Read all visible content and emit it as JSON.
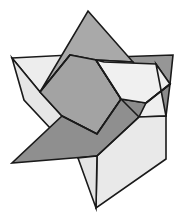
{
  "figure": {
    "canvas": {
      "width": 186,
      "height": 221,
      "background": "#ffffff"
    },
    "palette": {
      "medium_gray": "#a8a8a8",
      "dark_gray": "#909090",
      "light_gray": "#e2e2e2",
      "pale_gray": "#ededed",
      "bright_gray": "#f2f2f2",
      "outline": "#1a1a1a"
    },
    "star_points": [
      {
        "name": "top",
        "x": 88,
        "y": 11
      },
      {
        "name": "upper-left",
        "x": 12,
        "y": 58
      },
      {
        "name": "upper-right",
        "x": 173,
        "y": 55
      },
      {
        "name": "lower-left",
        "x": 12,
        "y": 163
      },
      {
        "name": "lower-right",
        "x": 166,
        "y": 159
      },
      {
        "name": "bottom",
        "x": 96,
        "y": 208
      }
    ],
    "ribbons": [
      {
        "name": "ribbon-medium",
        "fill": "#a8a8a8",
        "points": "88,11 146,72 122,98 139,117 95,150 62,116 46,90"
      },
      {
        "name": "ribbon-dark",
        "fill": "#909090",
        "points": "173,55 166,116 122,98 139,117 96,155 12,163 62,116"
      },
      {
        "name": "ribbon-light",
        "fill": "#e2e2e2",
        "points": "12,58 96,60 139,117 166,159 96,208 62,116 46,90"
      }
    ]
  }
}
